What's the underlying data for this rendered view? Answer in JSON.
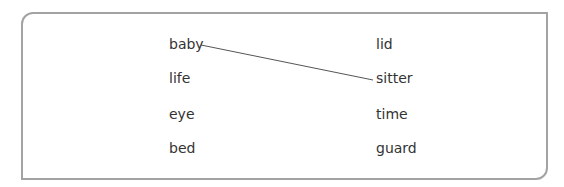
{
  "exercise": {
    "left_words": [
      "baby",
      "life",
      "eye",
      "bed"
    ],
    "right_words": [
      "lid",
      "sitter",
      "time",
      "guard"
    ],
    "connections": [
      {
        "from": "baby",
        "to": "sitter"
      }
    ]
  }
}
